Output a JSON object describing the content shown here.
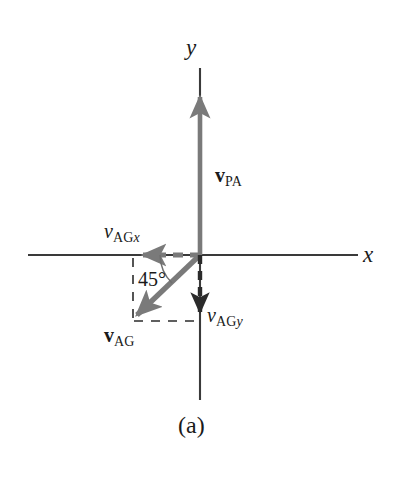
{
  "figure": {
    "caption": "(a)",
    "background_color": "#ffffff",
    "axis_color": "#3a3a3a",
    "vector_color": "#7a7a7a",
    "dash_color": "#2b2b2b",
    "text_color": "#1a1a1a",
    "width": 401,
    "height": 486
  },
  "axes": {
    "x_label": "x",
    "y_label": "y",
    "origin": {
      "x": 200,
      "y": 255
    },
    "x_range_px": {
      "start": 28,
      "end": 358
    },
    "y_range_px": {
      "start": 68,
      "end": 400
    }
  },
  "vectors": [
    {
      "name": "v-pa",
      "base_symbol": "v",
      "subscript": "PA",
      "style": "bold",
      "label_text": "vPA",
      "direction": "up",
      "from": {
        "x": 200,
        "y": 255
      },
      "to": {
        "x": 200,
        "y": 88
      },
      "line_style": "solid",
      "color": "#7a7a7a"
    },
    {
      "name": "v-ag",
      "base_symbol": "v",
      "subscript": "AG",
      "style": "bold",
      "label_text": "vAG",
      "direction": "down-left",
      "from": {
        "x": 200,
        "y": 255
      },
      "to": {
        "x": 131,
        "y": 321
      },
      "line_style": "solid",
      "color": "#7a7a7a"
    },
    {
      "name": "v-agx",
      "base_symbol": "v",
      "subscript": "AGx",
      "style": "italic",
      "label_text": "vAGx",
      "direction": "left",
      "from": {
        "x": 200,
        "y": 255
      },
      "to": {
        "x": 135,
        "y": 255
      },
      "line_style": "dashed",
      "color": "#7a7a7a"
    },
    {
      "name": "v-agy",
      "base_symbol": "v",
      "subscript": "AGy",
      "style": "italic",
      "label_text": "vAGy",
      "direction": "down",
      "from": {
        "x": 200,
        "y": 255
      },
      "to": {
        "x": 200,
        "y": 320
      },
      "line_style": "dashed",
      "color": "#2b2b2b"
    }
  ],
  "angle": {
    "value": "45",
    "unit": "°",
    "text": "45°",
    "from_direction": "negative-x-axis",
    "to_direction": "v-ag",
    "vertex": {
      "x": 200,
      "y": 255
    }
  },
  "construction_lines": [
    {
      "name": "left-vertical-dashed",
      "from": {
        "x": 133,
        "y": 258
      },
      "to": {
        "x": 133,
        "y": 320
      },
      "style": "dashed"
    },
    {
      "name": "bottom-horizontal-dashed",
      "from": {
        "x": 135,
        "y": 321
      },
      "to": {
        "x": 200,
        "y": 321
      },
      "style": "dashed"
    }
  ],
  "labels": {
    "y_axis": "y",
    "x_axis": "x",
    "v_pa_base": "v",
    "v_pa_sub": "PA",
    "v_ag_base": "v",
    "v_ag_sub": "AG",
    "v_agx_base": "v",
    "v_agx_sub_main": "AG",
    "v_agx_sub_ital": "x",
    "v_agy_base": "v",
    "v_agy_sub_main": "AG",
    "v_agy_sub_ital": "y",
    "angle": "45°",
    "caption": "(a)"
  }
}
